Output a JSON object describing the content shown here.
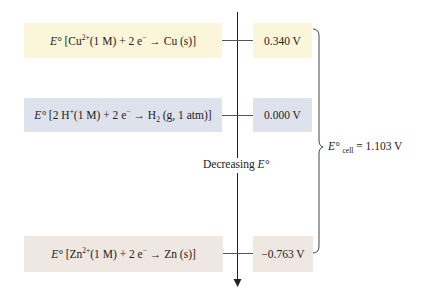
{
  "colors": {
    "cu_box": "#fbf6da",
    "h_box": "#dde2ec",
    "zn_box": "#efe7e2",
    "axis": "#222222"
  },
  "rows": [
    {
      "name": "copper",
      "prefix": "E°",
      "equation_parts": [
        "[Cu",
        "2+",
        "(1 M) + 2 e",
        "−",
        " → Cu (s)]"
      ],
      "value": "0.340 V"
    },
    {
      "name": "hydrogen",
      "prefix": "E°",
      "equation_parts": [
        "[2 H",
        "+",
        "(1 M) + 2 e",
        "−",
        " → H",
        "2",
        " (g, 1 atm)]"
      ],
      "value": "0.000 V"
    },
    {
      "name": "zinc",
      "prefix": "E°",
      "equation_parts": [
        "[Zn",
        "2+",
        "(1 M) + 2 e",
        "−",
        " → Zn (s)]"
      ],
      "value": "−0.763 V"
    }
  ],
  "axis_label": {
    "text": "Decreasing ",
    "symbol": "E°"
  },
  "cell": {
    "symbol": "E°",
    "subscript": "cell",
    "equals": " = 1.103 V"
  }
}
